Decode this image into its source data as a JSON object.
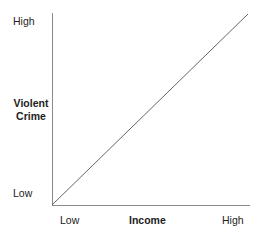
{
  "chart_data": {
    "type": "line",
    "title": "",
    "subtitle": "",
    "xlabel": "Income",
    "ylabel": "Violent Crime",
    "ylabel_lines": [
      "Violent",
      "Crime"
    ],
    "x_tick_labels": [
      "Low",
      "High"
    ],
    "y_tick_labels": [
      "Low",
      "High"
    ],
    "xlim": [
      0,
      1
    ],
    "ylim": [
      0,
      1
    ],
    "grid": false,
    "legend": null,
    "annotations": [],
    "series": [
      {
        "name": "Violent crime vs income",
        "x": [
          0,
          1
        ],
        "values": [
          0,
          1
        ],
        "style": "straight-line",
        "color": "#555555"
      }
    ]
  },
  "figure": {
    "background_color": "#ffffff",
    "axis_color": "#8a8a8a",
    "line_color": "#555555",
    "text_color": "#222222"
  },
  "axes": {
    "y": {
      "title_line1": "Violent",
      "title_line2": "Crime",
      "high_label": "High",
      "low_label": "Low"
    },
    "x": {
      "title": "Income",
      "high_label": "High",
      "low_label": "Low"
    }
  }
}
